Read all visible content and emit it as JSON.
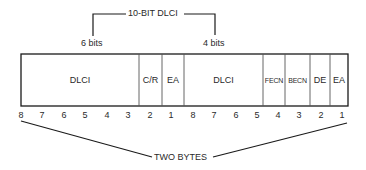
{
  "bracket": {
    "label": "10-BIT DLCI",
    "left_label": "6 bits",
    "right_label": "4 bits"
  },
  "fields": [
    {
      "label": "DLCI",
      "bits": 6
    },
    {
      "label": "C/R",
      "bits": 1
    },
    {
      "label": "EA",
      "bits": 1
    },
    {
      "label": "DLCI",
      "bits": 4
    },
    {
      "label": "FECN",
      "bits": 1
    },
    {
      "label": "BECN",
      "bits": 1
    },
    {
      "label": "DE",
      "bits": 1
    },
    {
      "label": "EA",
      "bits": 1
    }
  ],
  "bit_numbers": {
    "byte1": [
      "8",
      "7",
      "6",
      "5",
      "4",
      "3",
      "2",
      "1"
    ],
    "byte2": [
      "8",
      "7",
      "6",
      "5",
      "4",
      "3",
      "2",
      "1"
    ]
  },
  "footer_label": "TWO BYTES",
  "colors": {
    "line": "#1a1a1a",
    "divider": "#555555"
  }
}
